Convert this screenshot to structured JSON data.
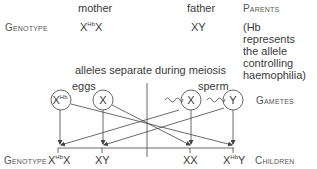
{
  "labels": {
    "mother": "mother",
    "father": "father",
    "parents": "Parents",
    "genotype_top": "Genotype",
    "mother_genotype_base1": "X",
    "mother_genotype_sup": "Hb",
    "mother_genotype_base2": "X",
    "father_genotype": "XY",
    "note": "(Hb represents the allele controlling haemophilia)",
    "meiosis": "alleles separate during meiosis",
    "eggs": "eggs",
    "sperm": "sperm",
    "gametes": "Gametes",
    "genotype_bottom": "Genotype",
    "children": "Children"
  },
  "gametes": [
    {
      "base": "X",
      "sup": "Hb",
      "type": "egg"
    },
    {
      "base": "X",
      "sup": "",
      "type": "egg"
    },
    {
      "base": "X",
      "sup": "",
      "type": "sperm"
    },
    {
      "base": "Y",
      "sup": "",
      "type": "sperm"
    }
  ],
  "children": [
    {
      "base1": "X",
      "sup": "Hb",
      "base2": "X"
    },
    {
      "base1": "XY",
      "sup": "",
      "base2": ""
    },
    {
      "base1": "XX",
      "sup": "",
      "base2": ""
    },
    {
      "base1": "X",
      "sup": "Hb",
      "base2": "Y"
    }
  ],
  "colors": {
    "line": "#444444",
    "text": "#3a3a3a"
  }
}
